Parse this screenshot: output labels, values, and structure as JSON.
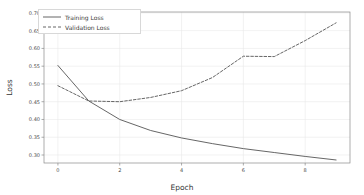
{
  "chart_data": {
    "type": "line",
    "title": "",
    "xlabel": "Epoch",
    "ylabel": "Loss",
    "x": [
      0,
      1,
      2,
      3,
      4,
      5,
      6,
      7,
      8,
      9
    ],
    "xlim": [
      -0.45,
      9.45
    ],
    "ylim": [
      0.2775,
      0.7025
    ],
    "xticks": [
      0,
      2,
      4,
      6,
      8
    ],
    "xtick_labels": [
      "0",
      "2",
      "4",
      "6",
      "8"
    ],
    "yticks": [
      0.3,
      0.35,
      0.4,
      0.45,
      0.5,
      0.55,
      0.6,
      0.65,
      0.7
    ],
    "ytick_labels": [
      "0.30",
      "0.35",
      "0.40",
      "0.45",
      "0.50",
      "0.55",
      "0.60",
      "0.65",
      "0.70"
    ],
    "grid": true,
    "legend_position": "upper left",
    "series": [
      {
        "name": "Training Loss",
        "style": "solid",
        "color": "#555555",
        "values": [
          0.552,
          0.452,
          0.4,
          0.369,
          0.348,
          0.332,
          0.318,
          0.307,
          0.296,
          0.286
        ]
      },
      {
        "name": "Validation Loss",
        "style": "dashed",
        "color": "#555555",
        "values": [
          0.495,
          0.452,
          0.45,
          0.462,
          0.481,
          0.518,
          0.578,
          0.577,
          0.622,
          0.672
        ]
      }
    ]
  },
  "legend": {
    "entries": [
      {
        "label": "Training Loss"
      },
      {
        "label": "Validation Loss"
      }
    ]
  },
  "axes": {
    "xlabel": "Epoch",
    "ylabel": "Loss"
  },
  "colors": {
    "background": "#ffffff",
    "grid": "#eaeaea",
    "axis": "#8a8a8a",
    "line": "#555555",
    "text": "#3a3a3a"
  }
}
